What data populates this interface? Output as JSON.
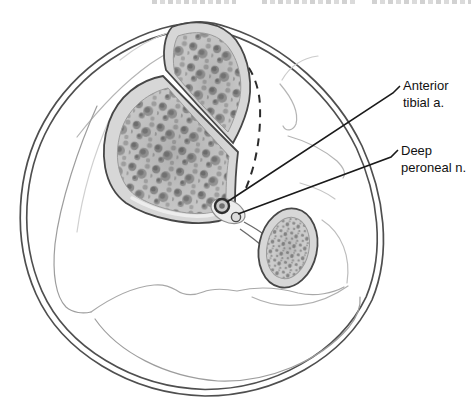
{
  "figure": {
    "kind": "anatomical-line-illustration",
    "labels": [
      {
        "id": "anterior-tibial-artery",
        "lines": [
          "Anterior",
          "tibial a."
        ]
      },
      {
        "id": "deep-peroneal-nerve",
        "lines": [
          "Deep",
          "peroneal n."
        ]
      }
    ],
    "colors": {
      "background": "#ffffff",
      "bone_cortex": "#d7d7d7",
      "trabecular_base": "#c6c6c6",
      "trabecular_dot": "#8b8b8b",
      "outline": "#474747",
      "contour_light": "#b5b5b5",
      "leader_line": "#1a1a1a",
      "label_text": "#111111"
    }
  }
}
